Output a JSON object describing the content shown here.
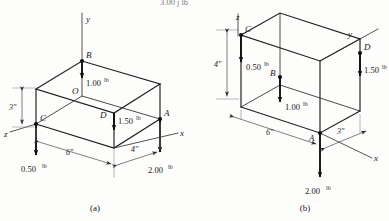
{
  "figure": {
    "top_fragment": "3.00 j lb",
    "captions": {
      "a": "(a)",
      "b": "(b)"
    }
  },
  "panel_a": {
    "caption": "(a)",
    "axes": [
      {
        "name": "y",
        "label": "y"
      },
      {
        "name": "x",
        "label": "x"
      },
      {
        "name": "z",
        "label": "z"
      }
    ],
    "points": [
      {
        "id": "O",
        "label": "O"
      },
      {
        "id": "A",
        "label": "A"
      },
      {
        "id": "B",
        "label": "B"
      },
      {
        "id": "C",
        "label": "C"
      },
      {
        "id": "D",
        "label": "D"
      }
    ],
    "forces": [
      {
        "at": "B",
        "value": "1.00",
        "unit": "lb",
        "direction": "down"
      },
      {
        "at": "D",
        "value": "1.50",
        "unit": "lb",
        "direction": "down"
      },
      {
        "at": "C",
        "value": "0.50",
        "unit": "lb",
        "direction": "down"
      },
      {
        "at": "A",
        "value": "2.00",
        "unit": "lb",
        "direction": "down"
      }
    ],
    "dimensions": [
      {
        "name": "height",
        "label": "3\""
      },
      {
        "name": "width",
        "label": "6\""
      },
      {
        "name": "depth",
        "label": "4\""
      }
    ]
  },
  "panel_b": {
    "caption": "(b)",
    "axes": [
      {
        "name": "z",
        "label": "z"
      },
      {
        "name": "y",
        "label": "y"
      },
      {
        "name": "x",
        "label": "x"
      }
    ],
    "points": [
      {
        "id": "A",
        "label": "A"
      },
      {
        "id": "B",
        "label": "B"
      },
      {
        "id": "C",
        "label": "C"
      },
      {
        "id": "D",
        "label": "D"
      }
    ],
    "forces": [
      {
        "at": "C",
        "value": "0.50",
        "unit": "lb",
        "direction": "down"
      },
      {
        "at": "B",
        "value": "1.00",
        "unit": "lb",
        "direction": "down"
      },
      {
        "at": "D",
        "value": "1.50",
        "unit": "lb",
        "direction": "down"
      },
      {
        "at": "A",
        "value": "2.00",
        "unit": "lb",
        "direction": "down"
      }
    ],
    "dimensions": [
      {
        "name": "height",
        "label": "4\""
      },
      {
        "name": "width",
        "label": "6\""
      },
      {
        "name": "depth",
        "label": "3\""
      }
    ]
  }
}
